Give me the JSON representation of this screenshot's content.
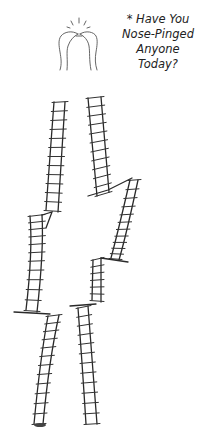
{
  "caption": {
    "lines": [
      "* Have You",
      "Nose-Pinged",
      "Anyone",
      "Today?"
    ]
  },
  "illustration": {
    "subject": "two ladder-bodied figures touching noses",
    "ink_color": "#2a2a2a",
    "background": "#ffffff"
  }
}
